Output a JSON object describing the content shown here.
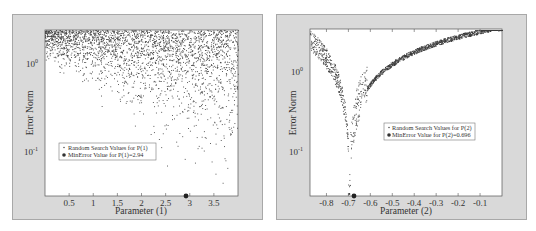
{
  "chart_data": [
    {
      "type": "scatter",
      "title": "",
      "xlabel": "Parameter (1)",
      "ylabel": "Error Norm",
      "yscale": "log",
      "xlim": [
        0,
        4
      ],
      "ylim": [
        0.032,
        2.45
      ],
      "x_ticks": [
        0.5,
        1,
        1.5,
        2,
        2.5,
        3,
        3.5
      ],
      "x_tick_labels": [
        "0.5",
        "1",
        "1.5",
        "2",
        "2.5",
        "3",
        "3.5"
      ],
      "y_ticks": [
        1,
        0.1
      ],
      "y_tick_labels": [
        "10^0",
        "10^-1"
      ],
      "grid": false,
      "legend_position": "lower left",
      "series": [
        {
          "name": "Random Search Values for P(1)",
          "marker": "dot",
          "description": "uniformly dense near top (error ~1-2.4), sparse toward low error; lower envelope rises toward low parameter values"
        },
        {
          "name": "MinError Value for P(1)=2.94",
          "marker": "filled-circle",
          "points": [
            [
              2.94,
              0.032
            ]
          ]
        }
      ]
    },
    {
      "type": "scatter",
      "title": "",
      "xlabel": "Parameter (2)",
      "ylabel": "Error Norm",
      "yscale": "log",
      "xlim": [
        -0.875,
        0.0
      ],
      "ylim": [
        0.028,
        3.4
      ],
      "x_ticks": [
        -0.8,
        -0.7,
        -0.6,
        -0.5,
        -0.4,
        -0.3,
        -0.2,
        -0.1
      ],
      "x_tick_labels": [
        "-0.8",
        "-0.7",
        "-0.6",
        "-0.5",
        "-0.4",
        "-0.3",
        "-0.2",
        "-0.1"
      ],
      "y_ticks": [
        1,
        0.1
      ],
      "y_tick_labels": [
        "10^0",
        "10^-1"
      ],
      "grid": false,
      "legend_position": "center right",
      "series": [
        {
          "name": "Random Search Values for P(2)",
          "marker": "dot",
          "description": "V-shaped cusp with minimum at -0.696; error ~2 at -0.875 decreasing to ~0.03 at -0.7 then rising to ~3.4 at 0"
        },
        {
          "name": "MinError Value for P(2)=0.696",
          "marker": "filled-circle",
          "points": [
            [
              -0.696,
              0.028
            ]
          ]
        }
      ]
    }
  ],
  "left": {
    "ylabel": "Error Norm",
    "xlabel": "Parameter (1)",
    "ytick_0_base": "10",
    "ytick_0_exp": "0",
    "ytick_1_base": "10",
    "ytick_1_exp": "-1",
    "legend_1": "Random Search Values for P(1)",
    "legend_2": "MinError Value for P(1)=2.94"
  },
  "right": {
    "ylabel": "Error Norm",
    "xlabel": "Parameter (2)",
    "ytick_0_base": "10",
    "ytick_0_exp": "0",
    "ytick_1_base": "10",
    "ytick_1_exp": "-1",
    "legend_1": "Random Search Values for P(2)",
    "legend_2": "MinError Value for P(2)=0.696"
  },
  "colors": {
    "frame": "#d9d9d9",
    "frame_border": "#a8a8a8",
    "plot_bg": "#ffffff",
    "marker": "#3a3a3a"
  }
}
